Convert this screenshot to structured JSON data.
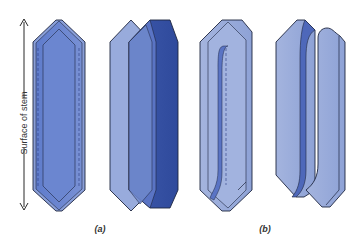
{
  "diagram": {
    "axis": {
      "label": "Surface of stem",
      "direction": "vertical-double-arrow"
    },
    "panels": [
      {
        "id": "a",
        "label": "(a)",
        "description": "Fusiform cell dividing periclinally — intact view and split into two daughter cells side by side"
      },
      {
        "id": "b",
        "label": "(b)",
        "description": "Fusiform cell dividing pseudotransversely — oblique division wall and separated daughter cells"
      }
    ],
    "colors": {
      "light_fill": "#8fa3d6",
      "mid_fill": "#6a85cc",
      "dark_fill": "#3f5aab",
      "pale_fill": "#a9b9e0",
      "outline": "#1e2640",
      "background": "#ffffff"
    }
  }
}
